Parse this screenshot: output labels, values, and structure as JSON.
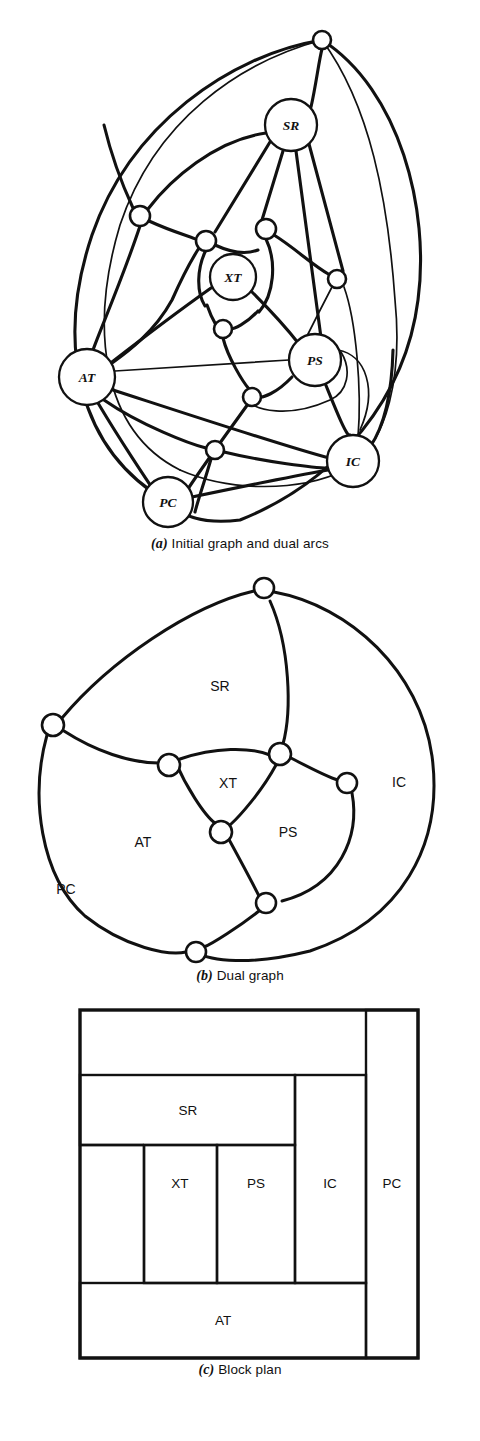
{
  "figures": [
    {
      "id": "initial-graph",
      "caption_tag": "(a)",
      "caption_text": "Initial graph and dual arcs",
      "nodes": [
        {
          "id": "SR",
          "label": "SR",
          "x": 291,
          "y": 125,
          "r": 26
        },
        {
          "id": "XT",
          "label": "XT",
          "x": 233,
          "y": 277,
          "r": 23
        },
        {
          "id": "AT",
          "label": "AT",
          "x": 87,
          "y": 377,
          "r": 28
        },
        {
          "id": "PS",
          "label": "PS",
          "x": 315,
          "y": 360,
          "r": 26
        },
        {
          "id": "IC",
          "label": "IC",
          "x": 353,
          "y": 461,
          "r": 26
        },
        {
          "id": "PC",
          "label": "PC",
          "x": 168,
          "y": 502,
          "r": 25
        }
      ],
      "dual_nodes": [
        {
          "id": "d1",
          "x": 322,
          "y": 40,
          "r": 9
        },
        {
          "id": "d2",
          "x": 140,
          "y": 216,
          "r": 10
        },
        {
          "id": "d3",
          "x": 206,
          "y": 241,
          "r": 10
        },
        {
          "id": "d4",
          "x": 266,
          "y": 229,
          "r": 10
        },
        {
          "id": "d5",
          "x": 337,
          "y": 279,
          "r": 9
        },
        {
          "id": "d6",
          "x": 223,
          "y": 329,
          "r": 9
        },
        {
          "id": "d7",
          "x": 252,
          "y": 397,
          "r": 9
        },
        {
          "id": "d8",
          "x": 215,
          "y": 450,
          "r": 9
        }
      ]
    },
    {
      "id": "dual-graph",
      "caption_tag": "(b)",
      "caption_text": "Dual graph",
      "region_labels": [
        {
          "id": "SR",
          "label": "SR",
          "x": 220,
          "y": 700
        },
        {
          "id": "XT",
          "label": "XT",
          "x": 228,
          "y": 797
        },
        {
          "id": "AT",
          "label": "AT",
          "x": 143,
          "y": 856
        },
        {
          "id": "PS",
          "label": "PS",
          "x": 288,
          "y": 846
        },
        {
          "id": "IC",
          "label": "IC",
          "x": 399,
          "y": 796
        },
        {
          "id": "PC",
          "label": "PC",
          "x": 66,
          "y": 903
        }
      ],
      "vertices": [
        {
          "id": "v-top",
          "x": 264,
          "y": 602,
          "r": 10
        },
        {
          "id": "v-left",
          "x": 53,
          "y": 739,
          "r": 11
        },
        {
          "id": "v-xt-l",
          "x": 169,
          "y": 779,
          "r": 11
        },
        {
          "id": "v-xt-r",
          "x": 280,
          "y": 768,
          "r": 11
        },
        {
          "id": "v-right",
          "x": 347,
          "y": 797,
          "r": 10
        },
        {
          "id": "v-xt-b",
          "x": 221,
          "y": 846,
          "r": 11
        },
        {
          "id": "v-ps-b",
          "x": 266,
          "y": 917,
          "r": 10
        },
        {
          "id": "v-bottom",
          "x": 196,
          "y": 966,
          "r": 10
        }
      ]
    },
    {
      "id": "block-plan",
      "caption_tag": "(c)",
      "caption_text": "Block plan",
      "blocks": [
        {
          "id": "SR",
          "label": "SR",
          "x": 80,
          "y": 1105,
          "w": 215,
          "h": 70
        },
        {
          "id": "XT",
          "label": "XT",
          "x": 144,
          "y": 1175,
          "w": 73,
          "h": 138
        },
        {
          "id": "PS",
          "label": "PS",
          "x": 217,
          "y": 1175,
          "w": 71,
          "h": 138
        },
        {
          "id": "IC",
          "label": "IC",
          "x": 295,
          "y": 1105,
          "w": 71,
          "h": 208
        },
        {
          "id": "PC",
          "label": "PC",
          "x": 366,
          "y": 1040,
          "w": 52,
          "h": 348
        },
        {
          "id": "AT",
          "label": "AT",
          "x": 80,
          "y": 1313,
          "w": 286,
          "h": 75
        }
      ],
      "outer": {
        "x": 80,
        "y": 1040,
        "w": 338,
        "h": 348
      }
    }
  ]
}
